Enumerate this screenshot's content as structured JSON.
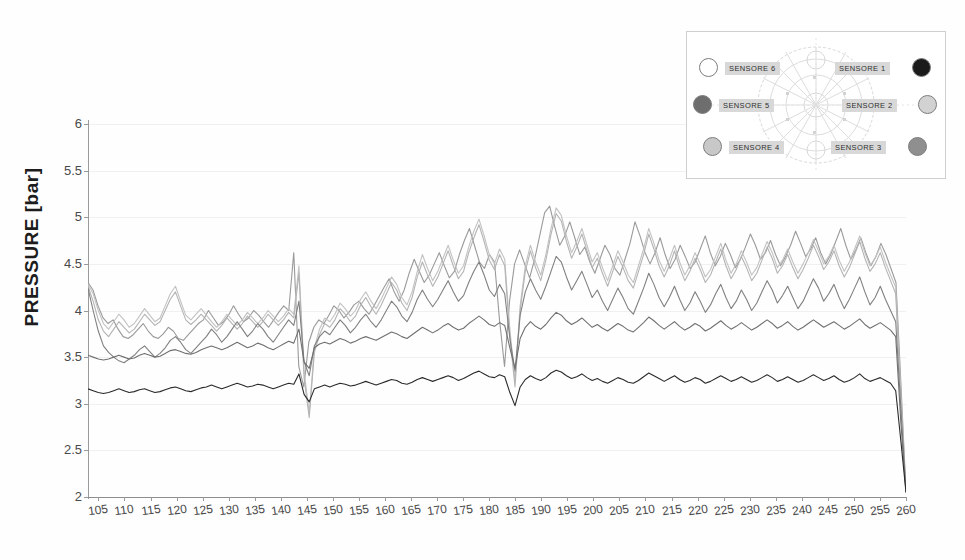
{
  "chart_data": {
    "type": "line",
    "title": "",
    "xlabel": "",
    "ylabel": "PRESSURE [bar]",
    "ylim": [
      2,
      6
    ],
    "xlim": [
      103,
      260
    ],
    "grid": true,
    "legend_position": "inset-top-right",
    "ytick_labels": [
      "6",
      "5.5",
      "5",
      "4.5",
      "4",
      "3.5",
      "3",
      "2.5",
      "2"
    ],
    "ytick_values": [
      6,
      5.5,
      5,
      4.5,
      4,
      3.5,
      3,
      2.5,
      2
    ],
    "xtick_labels": [
      "105",
      "110",
      "115",
      "120",
      "125",
      "130",
      "135",
      "140",
      "145",
      "150",
      "155",
      "160",
      "165",
      "170",
      "175",
      "180",
      "185",
      "190",
      "195",
      "200",
      "205",
      "210",
      "215",
      "220",
      "225",
      "230",
      "235",
      "240",
      "245",
      "250",
      "255",
      "260"
    ],
    "xtick_values": [
      105,
      110,
      115,
      120,
      125,
      130,
      135,
      140,
      145,
      150,
      155,
      160,
      165,
      170,
      175,
      180,
      185,
      190,
      195,
      200,
      205,
      210,
      215,
      220,
      225,
      230,
      235,
      240,
      245,
      250,
      255,
      260
    ],
    "series": [
      {
        "name": "SENSORE 1",
        "color": "#9a9a9a",
        "values": [
          4.3,
          4.22,
          4.05,
          3.92,
          3.86,
          3.9,
          3.8,
          3.72,
          3.7,
          3.74,
          3.8,
          3.86,
          3.78,
          3.72,
          3.7,
          3.75,
          3.82,
          3.78,
          3.7,
          3.68,
          3.74,
          3.8,
          3.86,
          3.9,
          4.0,
          3.92,
          3.84,
          3.88,
          3.95,
          4.05,
          3.96,
          3.88,
          3.92,
          4.0,
          3.95,
          3.88,
          3.82,
          3.9,
          3.98,
          4.05,
          4.0,
          4.62,
          3.4,
          3.18,
          3.66,
          3.82,
          3.9,
          3.86,
          3.95,
          4.05,
          4.0,
          3.92,
          3.98,
          4.06,
          4.1,
          4.02,
          3.96,
          4.05,
          4.15,
          4.25,
          4.34,
          4.2,
          4.1,
          4.22,
          4.4,
          4.55,
          4.42,
          4.3,
          4.38,
          4.5,
          4.62,
          4.48,
          4.35,
          4.42,
          4.6,
          4.75,
          4.88,
          4.7,
          4.52,
          4.45,
          4.6,
          4.52,
          3.9,
          3.4,
          4.1,
          4.5,
          4.65,
          4.5,
          4.35,
          4.55,
          4.8,
          5.05,
          5.12,
          4.9,
          4.7,
          4.8,
          4.95,
          4.78,
          4.6,
          4.68,
          4.52,
          4.4,
          4.55,
          4.7,
          4.6,
          4.45,
          4.38,
          4.55,
          4.72,
          4.95,
          4.8,
          4.62,
          4.5,
          4.62,
          4.78,
          4.6,
          4.45,
          4.55,
          4.7,
          4.58,
          4.45,
          4.52,
          4.66,
          4.8,
          4.62,
          4.48,
          4.58,
          4.72,
          4.6,
          4.46,
          4.55,
          4.68,
          4.82,
          4.7,
          4.55,
          4.62,
          4.75,
          4.6,
          4.48,
          4.58,
          4.7,
          4.85,
          4.72,
          4.58,
          4.66,
          4.78,
          4.62,
          4.5,
          4.6,
          4.74,
          4.88,
          4.7,
          4.55,
          4.65,
          4.78,
          4.62,
          4.48,
          4.58,
          4.72,
          4.6,
          4.45,
          4.3,
          3.2,
          2.05
        ]
      },
      {
        "name": "SENSORE 2",
        "color": "#c2c2c2",
        "values": [
          4.28,
          4.18,
          4.0,
          3.86,
          3.8,
          3.88,
          3.96,
          3.9,
          3.82,
          3.86,
          3.94,
          4.02,
          3.95,
          3.88,
          3.92,
          4.05,
          4.18,
          4.26,
          4.1,
          3.95,
          3.9,
          3.96,
          4.02,
          3.95,
          3.88,
          3.82,
          3.88,
          3.96,
          3.9,
          3.84,
          3.9,
          3.98,
          3.92,
          3.86,
          3.92,
          4.0,
          3.94,
          3.88,
          3.94,
          4.02,
          3.96,
          4.48,
          3.35,
          2.9,
          3.6,
          3.8,
          3.92,
          3.88,
          3.96,
          4.08,
          4.02,
          3.94,
          4.0,
          4.12,
          4.2,
          4.1,
          4.02,
          4.12,
          4.24,
          4.36,
          4.28,
          4.14,
          4.06,
          4.2,
          4.42,
          4.6,
          4.45,
          4.32,
          4.42,
          4.56,
          4.7,
          4.54,
          4.4,
          4.48,
          4.68,
          4.85,
          4.98,
          4.8,
          4.6,
          4.5,
          4.66,
          4.55,
          3.8,
          3.25,
          4.05,
          4.48,
          4.7,
          4.52,
          4.38,
          4.6,
          4.88,
          5.1,
          5.02,
          4.8,
          4.62,
          4.74,
          4.88,
          4.7,
          4.52,
          4.62,
          4.46,
          4.32,
          4.48,
          4.64,
          4.52,
          4.38,
          4.3,
          4.48,
          4.66,
          4.88,
          4.72,
          4.54,
          4.42,
          4.55,
          4.7,
          4.52,
          4.38,
          4.48,
          4.62,
          4.5,
          4.36,
          4.44,
          4.58,
          4.72,
          4.54,
          4.4,
          4.5,
          4.64,
          4.52,
          4.38,
          4.46,
          4.6,
          4.74,
          4.62,
          4.46,
          4.54,
          4.66,
          4.52,
          4.4,
          4.5,
          4.62,
          4.76,
          4.64,
          4.5,
          4.58,
          4.7,
          4.54,
          4.42,
          4.52,
          4.66,
          4.8,
          4.62,
          4.48,
          4.56,
          4.68,
          4.52,
          4.38,
          4.25,
          3.1,
          2.05
        ]
      },
      {
        "name": "SENSORE 3",
        "color": "#b4b4b4",
        "values": [
          4.26,
          4.1,
          3.9,
          3.78,
          3.72,
          3.8,
          3.88,
          3.82,
          3.76,
          3.8,
          3.88,
          3.96,
          3.9,
          3.84,
          3.88,
          4.0,
          4.12,
          4.2,
          4.05,
          3.9,
          3.85,
          3.9,
          3.96,
          3.9,
          3.84,
          3.78,
          3.84,
          3.92,
          3.86,
          3.8,
          3.86,
          3.94,
          3.88,
          3.82,
          3.88,
          3.96,
          3.9,
          3.84,
          3.9,
          3.98,
          3.92,
          4.4,
          3.28,
          2.85,
          3.55,
          3.74,
          3.86,
          3.82,
          3.9,
          4.02,
          3.96,
          3.88,
          3.94,
          4.06,
          4.14,
          4.04,
          3.96,
          4.06,
          4.18,
          4.3,
          4.22,
          4.08,
          4.0,
          4.14,
          4.36,
          4.52,
          4.38,
          4.26,
          4.36,
          4.5,
          4.64,
          4.48,
          4.34,
          4.42,
          4.62,
          4.78,
          4.92,
          4.74,
          4.54,
          4.44,
          4.6,
          4.48,
          3.72,
          3.18,
          4.0,
          4.42,
          4.64,
          4.46,
          4.32,
          4.54,
          4.82,
          5.04,
          4.96,
          4.74,
          4.56,
          4.68,
          4.82,
          4.64,
          4.46,
          4.56,
          4.4,
          4.26,
          4.42,
          4.58,
          4.46,
          4.32,
          4.24,
          4.42,
          4.6,
          4.82,
          4.66,
          4.48,
          4.36,
          4.48,
          4.64,
          4.46,
          4.32,
          4.42,
          4.56,
          4.44,
          4.3,
          4.38,
          4.52,
          4.66,
          4.48,
          4.34,
          4.44,
          4.58,
          4.46,
          4.32,
          4.4,
          4.54,
          4.68,
          4.56,
          4.4,
          4.48,
          4.6,
          4.46,
          4.34,
          4.44,
          4.56,
          4.7,
          4.58,
          4.44,
          4.52,
          4.64,
          4.48,
          4.36,
          4.46,
          4.6,
          4.74,
          4.56,
          4.42,
          4.5,
          4.62,
          4.46,
          4.32,
          4.18,
          3.05,
          2.05
        ]
      },
      {
        "name": "SENSORE 4",
        "color": "#808080",
        "values": [
          4.24,
          4.0,
          3.78,
          3.62,
          3.55,
          3.5,
          3.46,
          3.44,
          3.48,
          3.52,
          3.58,
          3.62,
          3.56,
          3.5,
          3.54,
          3.6,
          3.68,
          3.72,
          3.66,
          3.58,
          3.54,
          3.6,
          3.66,
          3.72,
          3.8,
          3.74,
          3.66,
          3.72,
          3.8,
          3.88,
          3.8,
          3.72,
          3.78,
          3.86,
          3.8,
          3.72,
          3.66,
          3.74,
          3.82,
          3.9,
          3.84,
          4.1,
          3.45,
          3.3,
          3.62,
          3.72,
          3.78,
          3.74,
          3.82,
          3.9,
          3.84,
          3.76,
          3.82,
          3.9,
          3.96,
          3.88,
          3.82,
          3.9,
          4.0,
          4.1,
          4.04,
          3.94,
          3.88,
          3.98,
          4.12,
          4.22,
          4.12,
          4.04,
          4.12,
          4.22,
          4.32,
          4.2,
          4.1,
          4.16,
          4.3,
          4.42,
          4.52,
          4.38,
          4.22,
          4.15,
          4.28,
          4.18,
          3.7,
          3.35,
          3.95,
          4.2,
          4.34,
          4.22,
          4.12,
          4.26,
          4.42,
          4.58,
          4.52,
          4.36,
          4.22,
          4.32,
          4.42,
          4.28,
          4.14,
          4.22,
          4.1,
          4.0,
          4.12,
          4.24,
          4.14,
          4.02,
          3.96,
          4.1,
          4.24,
          4.4,
          4.28,
          4.14,
          4.04,
          4.14,
          4.26,
          4.12,
          4.0,
          4.08,
          4.2,
          4.1,
          3.98,
          4.06,
          4.18,
          4.28,
          4.14,
          4.02,
          4.1,
          4.22,
          4.12,
          4.0,
          4.08,
          4.2,
          4.32,
          4.22,
          4.08,
          4.16,
          4.26,
          4.14,
          4.02,
          4.1,
          4.22,
          4.34,
          4.24,
          4.1,
          4.18,
          4.28,
          4.14,
          4.02,
          4.12,
          4.24,
          4.36,
          4.2,
          4.06,
          4.14,
          4.26,
          4.12,
          4.0,
          3.88,
          2.95,
          2.05
        ]
      },
      {
        "name": "SENSORE 5",
        "color": "#707070",
        "values": [
          3.52,
          3.5,
          3.48,
          3.47,
          3.48,
          3.5,
          3.52,
          3.5,
          3.48,
          3.49,
          3.52,
          3.54,
          3.52,
          3.5,
          3.51,
          3.54,
          3.57,
          3.58,
          3.56,
          3.54,
          3.53,
          3.55,
          3.58,
          3.6,
          3.62,
          3.6,
          3.58,
          3.6,
          3.63,
          3.66,
          3.63,
          3.6,
          3.62,
          3.65,
          3.63,
          3.6,
          3.58,
          3.61,
          3.64,
          3.67,
          3.65,
          3.8,
          3.45,
          3.38,
          3.6,
          3.64,
          3.66,
          3.64,
          3.67,
          3.7,
          3.68,
          3.65,
          3.67,
          3.7,
          3.72,
          3.7,
          3.68,
          3.71,
          3.74,
          3.77,
          3.75,
          3.72,
          3.7,
          3.74,
          3.78,
          3.82,
          3.79,
          3.76,
          3.79,
          3.83,
          3.86,
          3.82,
          3.79,
          3.81,
          3.86,
          3.9,
          3.94,
          3.9,
          3.85,
          3.83,
          3.87,
          3.84,
          3.6,
          3.38,
          3.7,
          3.82,
          3.88,
          3.83,
          3.8,
          3.85,
          3.92,
          3.98,
          3.95,
          3.89,
          3.85,
          3.88,
          3.92,
          3.87,
          3.82,
          3.85,
          3.81,
          3.78,
          3.82,
          3.86,
          3.83,
          3.79,
          3.77,
          3.82,
          3.87,
          3.93,
          3.89,
          3.84,
          3.8,
          3.84,
          3.88,
          3.83,
          3.79,
          3.82,
          3.86,
          3.83,
          3.78,
          3.81,
          3.85,
          3.89,
          3.84,
          3.8,
          3.83,
          3.87,
          3.83,
          3.79,
          3.82,
          3.86,
          3.9,
          3.86,
          3.81,
          3.84,
          3.88,
          3.83,
          3.79,
          3.82,
          3.86,
          3.9,
          3.86,
          3.82,
          3.85,
          3.88,
          3.84,
          3.8,
          3.83,
          3.87,
          3.91,
          3.85,
          3.81,
          3.84,
          3.87,
          3.83,
          3.79,
          3.72,
          2.8,
          2.05
        ]
      },
      {
        "name": "SENSORE 6",
        "color": "#2a2a2a",
        "values": [
          3.16,
          3.14,
          3.12,
          3.11,
          3.12,
          3.14,
          3.16,
          3.14,
          3.12,
          3.13,
          3.15,
          3.16,
          3.14,
          3.12,
          3.13,
          3.15,
          3.17,
          3.18,
          3.16,
          3.14,
          3.13,
          3.15,
          3.17,
          3.18,
          3.2,
          3.18,
          3.16,
          3.18,
          3.2,
          3.22,
          3.2,
          3.18,
          3.19,
          3.21,
          3.2,
          3.18,
          3.16,
          3.18,
          3.2,
          3.22,
          3.21,
          3.32,
          3.1,
          3.02,
          3.16,
          3.18,
          3.2,
          3.18,
          3.2,
          3.22,
          3.21,
          3.19,
          3.2,
          3.22,
          3.24,
          3.22,
          3.2,
          3.22,
          3.24,
          3.26,
          3.25,
          3.22,
          3.21,
          3.23,
          3.26,
          3.28,
          3.26,
          3.24,
          3.26,
          3.28,
          3.3,
          3.28,
          3.25,
          3.27,
          3.3,
          3.33,
          3.35,
          3.32,
          3.29,
          3.28,
          3.31,
          3.29,
          3.12,
          2.98,
          3.18,
          3.26,
          3.3,
          3.27,
          3.25,
          3.28,
          3.33,
          3.36,
          3.34,
          3.3,
          3.27,
          3.29,
          3.32,
          3.28,
          3.25,
          3.27,
          3.24,
          3.22,
          3.25,
          3.28,
          3.26,
          3.23,
          3.22,
          3.25,
          3.29,
          3.33,
          3.3,
          3.27,
          3.24,
          3.27,
          3.3,
          3.26,
          3.23,
          3.25,
          3.28,
          3.26,
          3.22,
          3.24,
          3.27,
          3.3,
          3.27,
          3.24,
          3.26,
          3.29,
          3.26,
          3.23,
          3.25,
          3.28,
          3.31,
          3.28,
          3.24,
          3.26,
          3.29,
          3.26,
          3.23,
          3.25,
          3.28,
          3.31,
          3.28,
          3.25,
          3.27,
          3.3,
          3.26,
          3.23,
          3.25,
          3.28,
          3.32,
          3.27,
          3.24,
          3.26,
          3.28,
          3.25,
          3.22,
          3.14,
          2.6,
          2.05
        ]
      }
    ]
  },
  "inset": {
    "sensors": [
      {
        "label": "SENSORE 6",
        "color": "#ffffff"
      },
      {
        "label": "SENSORE 1",
        "color": "#1b1b1b"
      },
      {
        "label": "SENSORE 5",
        "color": "#6e6e6e"
      },
      {
        "label": "SENSORE 2",
        "color": "#d2d2d2"
      },
      {
        "label": "SENSORE 4",
        "color": "#c8c8c8"
      },
      {
        "label": "SENSORE 3",
        "color": "#8f8f8f"
      }
    ]
  }
}
